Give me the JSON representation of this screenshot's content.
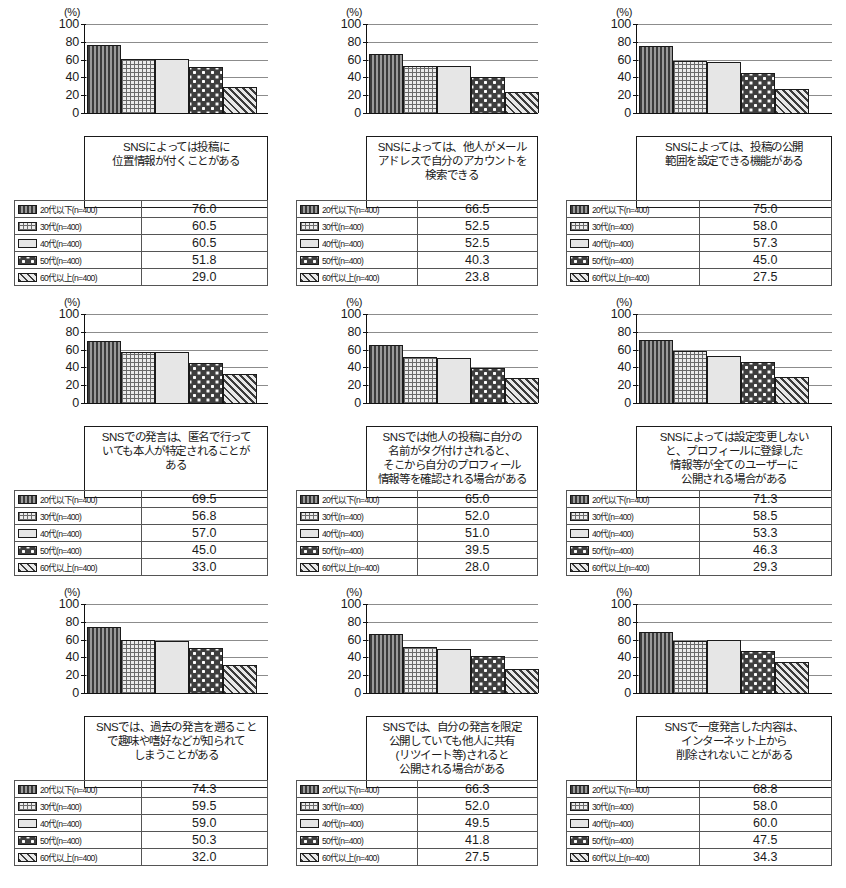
{
  "figure": {
    "unit_label": "(%)",
    "y_ticks": [
      100,
      80,
      60,
      40,
      20,
      0
    ],
    "series_names": [
      "20代以下(n=400)",
      "30代(n=400)",
      "40代(n=400)",
      "50代(n=400)",
      "60代以上(n=400)"
    ],
    "swatch_icons": [
      "vertical-stripe-swatch",
      "grid-hatch-swatch",
      "plain-light-swatch",
      "dotted-dark-swatch",
      "diagonal-hatch-swatch"
    ]
  },
  "chart_data": [
    {
      "type": "bar",
      "title": "SNSによっては投稿に\n位置情報が付くことがある",
      "categories": [
        "20代以下(n=400)",
        "30代(n=400)",
        "40代(n=400)",
        "50代(n=400)",
        "60代以上(n=400)"
      ],
      "values": [
        76.0,
        60.5,
        60.5,
        51.8,
        29.0
      ],
      "value_labels": [
        "76.0",
        "60.5",
        "60.5",
        "51.8",
        "29.0"
      ],
      "xlabel": "",
      "ylabel": "(%)",
      "ylim": [
        0,
        100
      ],
      "grid": true,
      "legend": "table-below"
    },
    {
      "type": "bar",
      "title": "SNSによっては、他人がメール\nアドレスで自分のアカウントを\n検索できる",
      "categories": [
        "20代以下(n=400)",
        "30代(n=400)",
        "40代(n=400)",
        "50代(n=400)",
        "60代以上(n=400)"
      ],
      "values": [
        66.5,
        52.5,
        52.5,
        40.3,
        23.8
      ],
      "value_labels": [
        "66.5",
        "52.5",
        "52.5",
        "40.3",
        "23.8"
      ],
      "xlabel": "",
      "ylabel": "(%)",
      "ylim": [
        0,
        100
      ],
      "grid": true,
      "legend": "table-below"
    },
    {
      "type": "bar",
      "title": "SNSによっては、投稿の公開\n範囲を設定できる機能がある",
      "categories": [
        "20代以下(n=400)",
        "30代(n=400)",
        "40代(n=400)",
        "50代(n=400)",
        "60代以上(n=400)"
      ],
      "values": [
        75.0,
        58.0,
        57.3,
        45.0,
        27.5
      ],
      "value_labels": [
        "75.0",
        "58.0",
        "57.3",
        "45.0",
        "27.5"
      ],
      "xlabel": "",
      "ylabel": "(%)",
      "ylim": [
        0,
        100
      ],
      "grid": true,
      "legend": "table-below"
    },
    {
      "type": "bar",
      "title": "SNSでの発言は、匿名で行って\nいても本人が特定されることが\nある",
      "categories": [
        "20代以下(n=400)",
        "30代(n=400)",
        "40代(n=400)",
        "50代(n=400)",
        "60代以上(n=400)"
      ],
      "values": [
        69.5,
        56.8,
        57.0,
        45.0,
        33.0
      ],
      "value_labels": [
        "69.5",
        "56.8",
        "57.0",
        "45.0",
        "33.0"
      ],
      "xlabel": "",
      "ylabel": "(%)",
      "ylim": [
        0,
        100
      ],
      "grid": true,
      "legend": "table-below"
    },
    {
      "type": "bar",
      "title": "SNSでは他人の投稿に自分の\n名前がタグ付けされると、\nそこから自分のプロフィール\n情報等を確認される場合がある",
      "categories": [
        "20代以下(n=400)",
        "30代(n=400)",
        "40代(n=400)",
        "50代(n=400)",
        "60代以上(n=400)"
      ],
      "values": [
        65.0,
        52.0,
        51.0,
        39.5,
        28.0
      ],
      "value_labels": [
        "65.0",
        "52.0",
        "51.0",
        "39.5",
        "28.0"
      ],
      "xlabel": "",
      "ylabel": "(%)",
      "ylim": [
        0,
        100
      ],
      "grid": true,
      "legend": "table-below"
    },
    {
      "type": "bar",
      "title": "SNSによっては設定変更しない\nと、プロフィールに登録した\n情報等が全てのユーザーに\n公開される場合がある",
      "categories": [
        "20代以下(n=400)",
        "30代(n=400)",
        "40代(n=400)",
        "50代(n=400)",
        "60代以上(n=400)"
      ],
      "values": [
        71.3,
        58.5,
        53.3,
        46.3,
        29.3
      ],
      "value_labels": [
        "71.3",
        "58.5",
        "53.3",
        "46.3",
        "29.3"
      ],
      "xlabel": "",
      "ylabel": "(%)",
      "ylim": [
        0,
        100
      ],
      "grid": true,
      "legend": "table-below"
    },
    {
      "type": "bar",
      "title": "SNSでは、過去の発言を遡ること\nで趣味や嗜好などが知られて\nしまうことがある",
      "categories": [
        "20代以下(n=400)",
        "30代(n=400)",
        "40代(n=400)",
        "50代(n=400)",
        "60代以上(n=400)"
      ],
      "values": [
        74.3,
        59.5,
        59.0,
        50.3,
        32.0
      ],
      "value_labels": [
        "74.3",
        "59.5",
        "59.0",
        "50.3",
        "32.0"
      ],
      "xlabel": "",
      "ylabel": "(%)",
      "ylim": [
        0,
        100
      ],
      "grid": true,
      "legend": "table-below"
    },
    {
      "type": "bar",
      "title": "SNSでは、自分の発言を限定\n公開していても他人に共有\n(リツイート等)されると\n公開される場合がある",
      "categories": [
        "20代以下(n=400)",
        "30代(n=400)",
        "40代(n=400)",
        "50代(n=400)",
        "60代以上(n=400)"
      ],
      "values": [
        66.3,
        52.0,
        49.5,
        41.8,
        27.5
      ],
      "value_labels": [
        "66.3",
        "52.0",
        "49.5",
        "41.8",
        "27.5"
      ],
      "xlabel": "",
      "ylabel": "(%)",
      "ylim": [
        0,
        100
      ],
      "grid": true,
      "legend": "table-below"
    },
    {
      "type": "bar",
      "title": "SNSで一度発言した内容は、\nインターネット上から\n削除されないことがある",
      "categories": [
        "20代以下(n=400)",
        "30代(n=400)",
        "40代(n=400)",
        "50代(n=400)",
        "60代以上(n=400)"
      ],
      "values": [
        68.8,
        58.0,
        60.0,
        47.5,
        34.3
      ],
      "value_labels": [
        "68.8",
        "58.0",
        "60.0",
        "47.5",
        "34.3"
      ],
      "xlabel": "",
      "ylabel": "(%)",
      "ylim": [
        0,
        100
      ],
      "grid": true,
      "legend": "table-below"
    }
  ]
}
